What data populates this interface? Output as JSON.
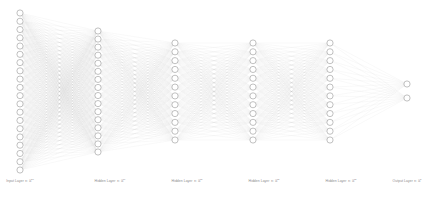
{
  "diagram": {
    "type": "neural-network-graph",
    "background_color": "#ffffff",
    "node_fill": "#ffffff",
    "node_stroke": "#9a9a9a",
    "edge_color": "#b9b9b9",
    "label_color": "#8a8a8a",
    "node_radius": 3.1,
    "width": 437,
    "height": 198,
    "layers": [
      {
        "id": "input-layer",
        "label_prefix": "Input Layer",
        "label_set": "∈ ℝ",
        "label_exponent": "20",
        "label_full": "Input Layer ∈ ℝ²⁰",
        "node_count": 20,
        "cx": 20,
        "top": 13,
        "bottom": 170,
        "label_x": 20,
        "label_y": 180
      },
      {
        "id": "hidden-layer-1",
        "label_prefix": "Hidden Layer",
        "label_set": "∈ ℝ",
        "label_exponent": "16",
        "label_full": "Hidden Layer ∈ ℝ¹⁶",
        "node_count": 16,
        "cx": 98,
        "top": 31,
        "bottom": 152,
        "label_x": 110,
        "label_y": 180
      },
      {
        "id": "hidden-layer-2",
        "label_prefix": "Hidden Layer",
        "label_set": "∈ ℝ",
        "label_exponent": "12",
        "label_full": "Hidden Layer ∈ ℝ¹²",
        "node_count": 12,
        "cx": 175,
        "top": 43,
        "bottom": 140,
        "label_x": 187,
        "label_y": 180
      },
      {
        "id": "hidden-layer-3",
        "label_prefix": "Hidden Layer",
        "label_set": "∈ ℝ",
        "label_exponent": "12",
        "label_full": "Hidden Layer ∈ ℝ¹²",
        "node_count": 12,
        "cx": 253,
        "top": 43,
        "bottom": 140,
        "label_x": 264,
        "label_y": 180
      },
      {
        "id": "hidden-layer-4",
        "label_prefix": "Hidden Layer",
        "label_set": "∈ ℝ",
        "label_exponent": "12",
        "label_full": "Hidden Layer ∈ ℝ¹²",
        "node_count": 12,
        "cx": 330,
        "top": 43,
        "bottom": 140,
        "label_x": 341,
        "label_y": 180
      },
      {
        "id": "output-layer",
        "label_prefix": "Output Layer",
        "label_set": "∈ ℝ",
        "label_exponent": "2",
        "label_full": "Output Layer ∈ ℝ²",
        "node_count": 2,
        "cx": 407,
        "top": 84,
        "bottom": 98,
        "label_x": 407,
        "label_y": 180
      }
    ],
    "connections": "fully-connected-between-adjacent-layers"
  }
}
